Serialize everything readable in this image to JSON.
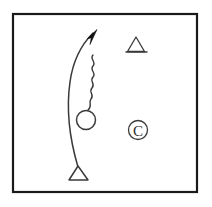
{
  "figure": {
    "background_color": "#ffffff",
    "frame": {
      "label": "diagram-border",
      "stroke_color": "#1a1a1a",
      "stroke_width": 2.2,
      "x": 13,
      "y": 14,
      "width": 184,
      "height": 178
    },
    "elements": [
      {
        "name": "curved-arrow",
        "type": "curve-with-arrowhead",
        "description": "Long slightly bowed vertical line curving up and to the right, ending in a solid filled arrowhead at the top",
        "stroke_color": "#3a3a3a",
        "start": {
          "x": 78,
          "y": 167
        },
        "end": {
          "x": 96,
          "y": 31
        },
        "arrowhead_filled": true,
        "arrowhead_color": "#111111"
      },
      {
        "name": "zigzag-wave",
        "type": "serpentine-line",
        "description": "Vertical wavy / zigzag line running alongside the arrow, from just below the arrowhead down to the circle",
        "stroke_color": "#3a3a3a",
        "top": {
          "x": 93,
          "y": 55
        },
        "bottom": {
          "x": 87,
          "y": 110
        },
        "amplitude": 4,
        "cycles": 6
      },
      {
        "name": "open-circle",
        "type": "circle",
        "description": "Unfilled circle at the lower end of the zigzag, sitting on the arrow curve",
        "center": {
          "x": 86,
          "y": 120
        },
        "radius": 9.5,
        "fill": "#ffffff",
        "stroke_color": "#3a3a3a"
      },
      {
        "name": "base-triangle",
        "type": "triangle",
        "description": "Open upright triangle anchoring the bottom of the curved arrow",
        "apex": {
          "x": 78,
          "y": 166
        },
        "base_left": {
          "x": 69,
          "y": 180
        },
        "base_right": {
          "x": 88,
          "y": 180
        },
        "fill": "#ffffff",
        "stroke_color": "#3a3a3a"
      },
      {
        "name": "narrow-triangle",
        "type": "triangle",
        "description": "Small narrow open triangle with wide baseline in the upper right area",
        "apex": {
          "x": 136,
          "y": 37
        },
        "base_left": {
          "x": 128,
          "y": 52
        },
        "base_right": {
          "x": 145,
          "y": 52
        },
        "fill": "#ffffff",
        "stroke_color": "#3a3a3a"
      },
      {
        "name": "copyright-symbol",
        "type": "circled-letter",
        "description": "Letter C enclosed in a circle, positioned in the lower right area",
        "letter": "C",
        "center": {
          "x": 138,
          "y": 130
        },
        "outer_radius": 9.5,
        "stroke_color": "#2b2b2b"
      }
    ]
  }
}
